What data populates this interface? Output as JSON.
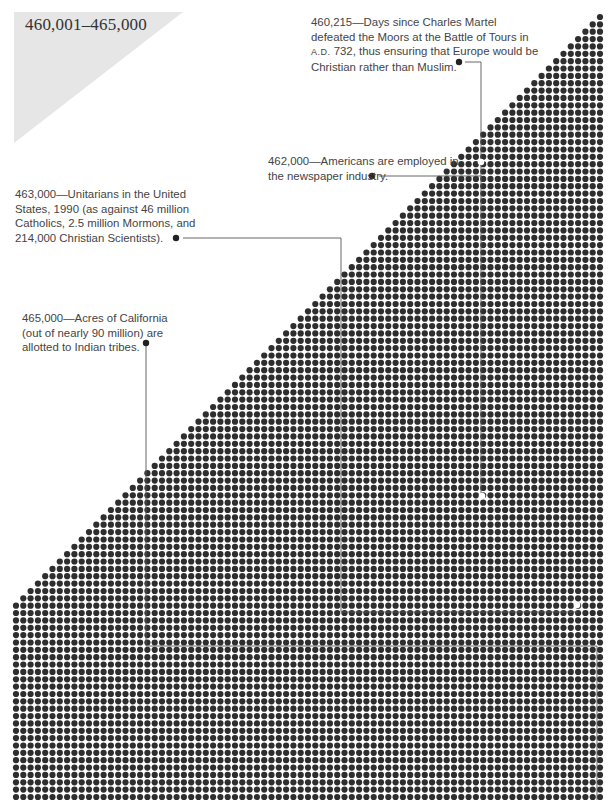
{
  "title": "460,001–465,000",
  "colors": {
    "dot": "#2e2e2e",
    "marker": "#ffffff",
    "leader": "#555555",
    "title_bg": "#e6e6e6",
    "text": "#444444"
  },
  "annotations": [
    {
      "id": "a460215",
      "lines": [
        "460,215—Days since Charles Martel",
        "defeated the Moors at the Battle of Tours in",
        "A.D. 732, thus ensuring that Europe would be",
        "Christian rather than Muslim."
      ]
    },
    {
      "id": "a462000",
      "lines": [
        "462,000—Americans are employed in",
        "the newspaper industry."
      ]
    },
    {
      "id": "a463000",
      "lines": [
        "463,000—Unitarians in the United",
        "States, 1990 (as against 46 million",
        "Catholics, 2.5 million Mormons, and",
        "214,000 Christian Scientists)."
      ]
    },
    {
      "id": "a465000",
      "lines": [
        "465,000—Acres of California",
        "(out of nearly 90 million) are",
        "allotted to Indian tribes."
      ]
    }
  ],
  "chart_data": {
    "type": "dot-matrix",
    "title": "460,001–465,000",
    "range_start": 460001,
    "range_end": 465000,
    "dot_count": 5000,
    "layout": "staircase triangle from top-right, then full rows",
    "columns": 81,
    "highlighted_values": [
      460215,
      462000,
      463000,
      465000
    ],
    "annotations": [
      {
        "value": 460215,
        "label": "Days since Charles Martel defeated the Moors at the Battle of Tours in A.D. 732"
      },
      {
        "value": 462000,
        "label": "Americans are employed in the newspaper industry"
      },
      {
        "value": 463000,
        "label": "Unitarians in the United States, 1990"
      },
      {
        "value": 465000,
        "label": "Acres of California allotted to Indian tribes"
      }
    ]
  }
}
